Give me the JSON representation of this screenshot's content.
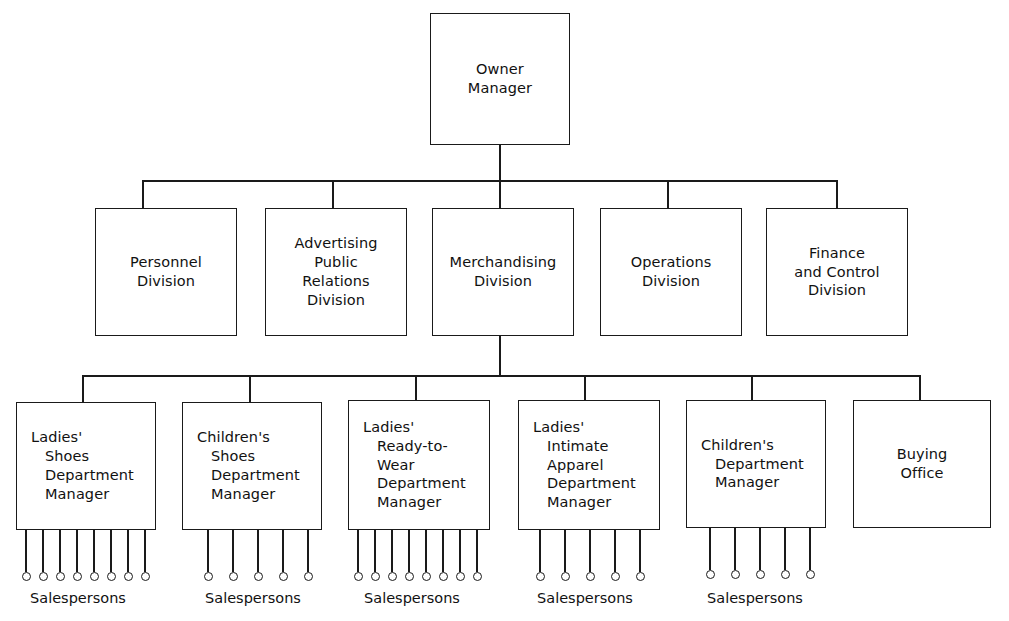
{
  "chart_data": {
    "type": "diagram",
    "diagram_kind": "organizational-hierarchy",
    "orientation": "top-down",
    "levels": 3,
    "nodes": [
      {
        "id": "owner-manager",
        "label": "Owner\nManager",
        "level": 1,
        "align": "center",
        "x": 430,
        "y": 13,
        "w": 140,
        "h": 132
      },
      {
        "id": "personnel-division",
        "label": "Personnel\nDivision",
        "level": 2,
        "align": "center",
        "x": 95,
        "y": 208,
        "w": 142,
        "h": 128
      },
      {
        "id": "advertising-public-relations-division",
        "label": "Advertising\nPublic\nRelations\nDivision",
        "level": 2,
        "align": "center",
        "x": 265,
        "y": 208,
        "w": 142,
        "h": 128
      },
      {
        "id": "merchandising-division",
        "label": "Merchandising\nDivision",
        "level": 2,
        "align": "center",
        "x": 432,
        "y": 208,
        "w": 142,
        "h": 128
      },
      {
        "id": "operations-division",
        "label": "Operations\nDivision",
        "level": 2,
        "align": "center",
        "x": 600,
        "y": 208,
        "w": 142,
        "h": 128
      },
      {
        "id": "finance-and-control-division",
        "label": "Finance\nand Control\nDivision",
        "level": 2,
        "align": "center",
        "x": 766,
        "y": 208,
        "w": 142,
        "h": 128
      },
      {
        "id": "ladies-shoes-department-manager",
        "label": "Ladies'\nShoes\nDepartment\nManager",
        "level": 3,
        "align": "indent",
        "x": 16,
        "y": 402,
        "w": 140,
        "h": 128
      },
      {
        "id": "childrens-shoes-department-manager",
        "label": "Children's\nShoes\nDepartment\nManager",
        "level": 3,
        "align": "indent",
        "x": 182,
        "y": 402,
        "w": 140,
        "h": 128
      },
      {
        "id": "ladies-ready-to-wear-department-manager",
        "label": "Ladies'\nReady-to-\nWear\nDepartment\nManager",
        "level": 3,
        "align": "indent",
        "x": 348,
        "y": 400,
        "w": 142,
        "h": 130
      },
      {
        "id": "ladies-intimate-apparel-department-manager",
        "label": "Ladies'\nIntimate\nApparel\nDepartment\nManager",
        "level": 3,
        "align": "indent",
        "x": 518,
        "y": 400,
        "w": 142,
        "h": 130
      },
      {
        "id": "childrens-department-manager",
        "label": "Children's\nDepartment\nManager",
        "level": 3,
        "align": "indent",
        "x": 686,
        "y": 400,
        "w": 140,
        "h": 128
      },
      {
        "id": "buying-office",
        "label": "Buying\nOffice",
        "level": 3,
        "align": "center",
        "x": 853,
        "y": 400,
        "w": 138,
        "h": 128
      }
    ],
    "salesperson_groups": [
      {
        "parent": "ladies-shoes-department-manager",
        "caption": "Salespersons",
        "count": 8,
        "start_x": 26,
        "spacing": 17,
        "top": 530,
        "stem_height": 42,
        "caption_center": 78,
        "caption_y": 590
      },
      {
        "parent": "childrens-shoes-department-manager",
        "caption": "Salespersons",
        "count": 5,
        "start_x": 208,
        "spacing": 25,
        "top": 530,
        "stem_height": 42,
        "caption_center": 253,
        "caption_y": 590
      },
      {
        "parent": "ladies-ready-to-wear-department-manager",
        "caption": "Salespersons",
        "count": 8,
        "start_x": 358,
        "spacing": 17,
        "top": 530,
        "stem_height": 42,
        "caption_center": 412,
        "caption_y": 590
      },
      {
        "parent": "ladies-intimate-apparel-department-manager",
        "caption": "Salespersons",
        "count": 5,
        "start_x": 540,
        "spacing": 25,
        "top": 530,
        "stem_height": 42,
        "caption_center": 585,
        "caption_y": 590
      },
      {
        "parent": "childrens-department-manager",
        "caption": "Salespersons",
        "count": 5,
        "start_x": 710,
        "spacing": 25,
        "top": 528,
        "stem_height": 42,
        "caption_center": 755,
        "caption_y": 590
      }
    ],
    "connectors": {
      "tier1_to_tier2": {
        "trunk_x": 500,
        "trunk_top": 145,
        "bus_y": 180,
        "bus_left": 143,
        "bus_right": 837,
        "drop_bottom": 208,
        "drop_x": [
          143,
          333,
          500,
          668,
          837
        ]
      },
      "tier2_to_tier3": {
        "trunk_x": 500,
        "trunk_top": 336,
        "bus_y": 375,
        "bus_left": 83,
        "bus_right": 920,
        "drop_bottom": 402,
        "drop_x": [
          83,
          250,
          416,
          585,
          752,
          920
        ]
      }
    },
    "style": {
      "background": "#ffffff",
      "line_color": "#1a1a1a",
      "text_color": "#111111",
      "box_fill": "#ffffff"
    }
  }
}
